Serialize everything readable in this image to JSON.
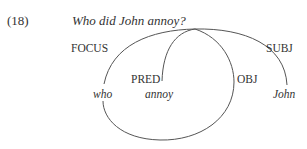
{
  "example": {
    "number": "(18)",
    "sentence": "Who did John annoy?"
  },
  "functions": {
    "focus": "FOCUS",
    "pred": "PRED",
    "obj": "OBJ",
    "subj": "SUBJ"
  },
  "words": {
    "who": "who",
    "annoy": "annoy",
    "john": "John"
  },
  "colors": {
    "text": "#333333",
    "line": "#555555",
    "background": "#ffffff"
  }
}
